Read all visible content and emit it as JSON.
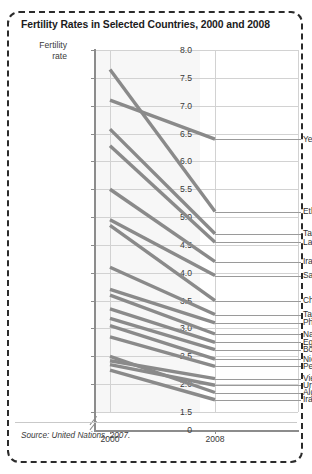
{
  "title": "Fertility Rates in Selected Countries, 2000 and 2008",
  "axis_title_line1": "Fertility",
  "axis_title_line2": "rate",
  "source": "Source: United Nations, 2007.",
  "colors": {
    "line": "#8a8a8a",
    "grid": "#d2d2d2",
    "axis": "#8c8c8c",
    "plot_bg": "#f7f7f7",
    "text": "#303030",
    "frame": "#2b2b2b"
  },
  "chart_data": {
    "type": "line",
    "subtype": "slope-chart",
    "title": "Fertility Rates in Selected Countries, 2000 and 2008",
    "xlabel": "",
    "ylabel": "Fertility rate",
    "x": [
      "2000",
      "2008"
    ],
    "xticklabels": [
      "2000",
      "2008"
    ],
    "ylim": [
      1.5,
      8.0
    ],
    "yticks": [
      0,
      1.5,
      2.0,
      2.5,
      3.0,
      3.5,
      4.0,
      4.5,
      5.0,
      5.5,
      6.0,
      6.5,
      7.0,
      7.5,
      8.0
    ],
    "yticklabels": [
      "0",
      "1.5",
      "2.0",
      "2.5",
      "3.0",
      "3.5",
      "4.0",
      "4.5",
      "5.0",
      "5.5",
      "6.0",
      "6.5",
      "7.0",
      "7.5",
      "8.0"
    ],
    "y_axis_break": true,
    "grid": true,
    "legend": "none",
    "series": [
      {
        "name": "Yemen",
        "values": [
          7.1,
          6.4
        ],
        "label_y": 6.4
      },
      {
        "name": "Ethiopia",
        "values": [
          7.65,
          5.1
        ],
        "label_y": 5.1
      },
      {
        "name": "Tanzania",
        "values": [
          6.58,
          4.7
        ],
        "label_y": 4.7
      },
      {
        "name": "Laos",
        "values": [
          6.28,
          4.55
        ],
        "label_y": 4.55
      },
      {
        "name": "Iraq",
        "values": [
          5.5,
          4.2
        ],
        "label_y": 4.2
      },
      {
        "name": "Saudi Arabia",
        "values": [
          4.95,
          3.95
        ],
        "label_y": 3.95
      },
      {
        "name": "Chad",
        "values": [
          4.85,
          3.5
        ],
        "label_y": 3.5
      },
      {
        "name": "Tajikistan",
        "values": [
          4.1,
          3.25
        ],
        "label_y": 3.25
      },
      {
        "name": "Philippines",
        "values": [
          3.7,
          3.1
        ],
        "label_y": 3.1
      },
      {
        "name": "Namibia",
        "values": [
          3.6,
          2.9
        ],
        "label_y": 2.9
      },
      {
        "name": "Egypt",
        "values": [
          3.35,
          2.75
        ],
        "label_y": 2.75
      },
      {
        "name": "Bolivia",
        "values": [
          3.18,
          2.62
        ],
        "label_y": 2.62
      },
      {
        "name": "Nicaragua",
        "values": [
          3.05,
          2.45
        ],
        "label_y": 2.45
      },
      {
        "name": "Peru",
        "values": [
          2.85,
          2.32
        ],
        "label_y": 2.32
      },
      {
        "name": "Vietnam",
        "values": [
          2.42,
          2.1
        ],
        "label_y": 2.1
      },
      {
        "name": "Uruguay",
        "values": [
          2.35,
          1.98
        ],
        "label_y": 1.98
      },
      {
        "name": "Algeria",
        "values": [
          2.5,
          1.85
        ],
        "label_y": 1.85
      },
      {
        "name": "Iran",
        "values": [
          2.25,
          1.72
        ],
        "label_y": 1.72
      }
    ]
  }
}
